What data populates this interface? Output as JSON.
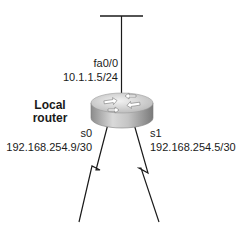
{
  "diagram": {
    "router": {
      "name_line1": "Local",
      "name_line2": "router",
      "icon": "router-icon"
    },
    "interfaces": {
      "fa0_0": {
        "name": "fa0/0",
        "ip": "10.1.1.5/24",
        "link": "ethernet-segment"
      },
      "s0": {
        "name": "s0",
        "ip": "192.168.254.9/30",
        "link": "serial-link"
      },
      "s1": {
        "name": "s1",
        "ip": "192.168.254.5/30",
        "link": "serial-link"
      }
    },
    "colors": {
      "line": "#1a1a1a",
      "router_top": "#d8d8d8",
      "router_side": "#a8a8a8"
    }
  }
}
